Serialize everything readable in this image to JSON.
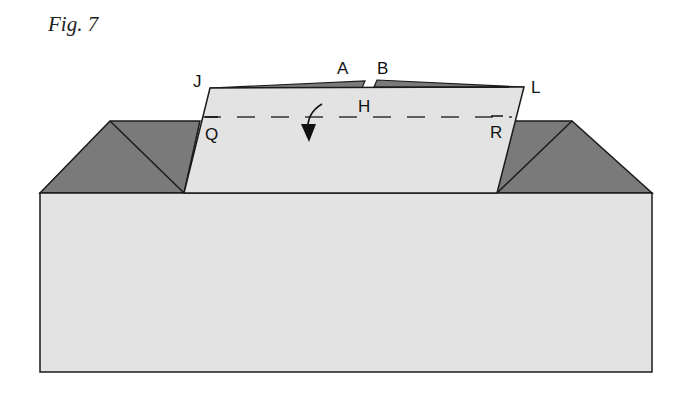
{
  "figure": {
    "title": "Fig. 7"
  },
  "colors": {
    "paper_light": "#e3e3e3",
    "paper_dark": "#7a7a7a",
    "stroke": "#1a1a1a"
  },
  "labels": {
    "J": "J",
    "A": "A",
    "B": "B",
    "L": "L",
    "H": "H",
    "Q": "Q",
    "R": "R"
  },
  "annotations": {
    "fold_line": "dashed valley fold line Q–R through H",
    "arrow": "curved fold-down arrow"
  }
}
